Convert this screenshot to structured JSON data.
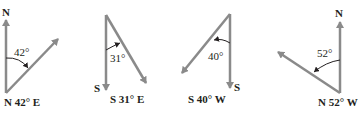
{
  "diagram": {
    "type": "compass-bearings",
    "colors": {
      "vector": "#8a8a8a",
      "arc": "#231f20",
      "text": "#231f20",
      "background": "#ffffff"
    },
    "panels": [
      {
        "id": "n42e",
        "reference": "N",
        "angle": "42°",
        "bearing": "N 42° E"
      },
      {
        "id": "s31e",
        "reference": "S",
        "angle": "31°",
        "bearing": "S 31° E"
      },
      {
        "id": "s40w",
        "reference": "S",
        "angle": "40°",
        "bearing": "S 40° W"
      },
      {
        "id": "n52w",
        "reference": "N",
        "angle": "52°",
        "bearing": "N 52° W"
      }
    ]
  }
}
